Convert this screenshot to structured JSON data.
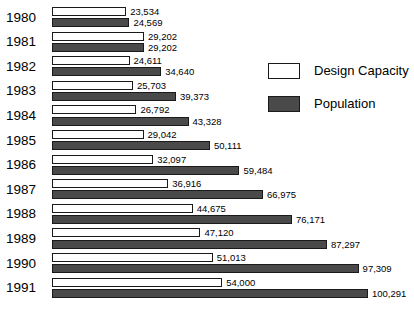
{
  "chart_data": {
    "type": "bar",
    "orientation": "horizontal",
    "title": "",
    "subtitle": "",
    "xlabel": "",
    "ylabel": "",
    "grid": false,
    "xlim": [
      0,
      100291
    ],
    "legend_position": "right-top",
    "categories": [
      "1980",
      "1981",
      "1982",
      "1983",
      "1984",
      "1985",
      "1986",
      "1987",
      "1988",
      "1989",
      "1990",
      "1991"
    ],
    "series": [
      {
        "name": "Design Capacity",
        "style": "white-outlined",
        "color": "#ffffff",
        "values": [
          23534,
          29202,
          24611,
          25703,
          26792,
          29042,
          32097,
          36916,
          44675,
          47120,
          51013,
          54000
        ],
        "labels": [
          "23,534",
          "29,202",
          "24,611",
          "25,703",
          "26,792",
          "29,042",
          "32,097",
          "36,916",
          "44,675",
          "47,120",
          "51,013",
          "54,000"
        ]
      },
      {
        "name": "Population",
        "style": "dark-filled",
        "color": "#4a4a4a",
        "values": [
          24569,
          29202,
          34640,
          39373,
          43328,
          50111,
          59484,
          66975,
          76171,
          87297,
          97309,
          100291
        ],
        "labels": [
          "24,569",
          "29,202",
          "34,640",
          "39,373",
          "43,328",
          "50,111",
          "59,484",
          "66,975",
          "76,171",
          "87,297",
          "97,309",
          "100,291"
        ]
      }
    ]
  },
  "legend": {
    "items": [
      {
        "label": "Design Capacity",
        "swatch": "capacity"
      },
      {
        "label": "Population",
        "swatch": "population"
      }
    ]
  }
}
